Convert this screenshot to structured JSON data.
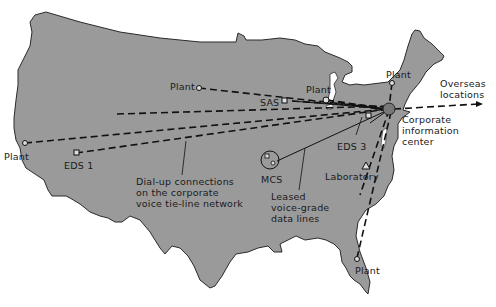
{
  "diagram": {
    "type": "network-map",
    "region": "Continental United States",
    "colors": {
      "land": "#9a9a9a",
      "outline": "#2a2a2a",
      "lines": "#1a1a1a",
      "background": "#ffffff"
    },
    "hub": {
      "label": "Corporate information center"
    },
    "nodes": [
      {
        "id": "plant_west",
        "label": "Plant",
        "symbol": "circle"
      },
      {
        "id": "eds1",
        "label": "EDS 1",
        "symbol": "square"
      },
      {
        "id": "plant_midwest",
        "label": "Plant",
        "symbol": "circle"
      },
      {
        "id": "sas",
        "label": "SAS",
        "symbol": "square"
      },
      {
        "id": "plant_greatlakes",
        "label": "Plant",
        "symbol": "circle"
      },
      {
        "id": "plant_newengland",
        "label": "Plant",
        "symbol": "circle"
      },
      {
        "id": "eds3",
        "label": "EDS 3",
        "symbol": "square"
      },
      {
        "id": "mcs",
        "label": "MCS",
        "symbol": "circle-with-squares"
      },
      {
        "id": "laboratory",
        "label": "Laboratory",
        "symbol": "triangle"
      },
      {
        "id": "plant_florida",
        "label": "Plant",
        "symbol": "circle"
      },
      {
        "id": "overseas",
        "label": "Overseas locations",
        "symbol": "arrow"
      }
    ],
    "labels": {
      "plant_west": "Plant",
      "eds1": "EDS 1",
      "plant_midwest": "Plant",
      "sas": "SAS",
      "plant_greatlakes": "Plant",
      "plant_newengland": "Plant",
      "eds3": "EDS 3",
      "mcs": "MCS",
      "laboratory": "Laboratory",
      "plant_florida": "Plant",
      "overseas": "Overseas\nlocations",
      "hub": "Corporate\ninformation\ncenter",
      "dialup_legend": "Dial-up connections\non the corporate\nvoice tie-line network",
      "leased_legend": "Leased\nvoice-grade\ndata lines"
    },
    "legend": [
      {
        "style": "dashed",
        "meaning": "Dial-up connections on the corporate voice tie-line network"
      },
      {
        "style": "solid",
        "meaning": "Leased voice-grade data lines"
      }
    ]
  }
}
